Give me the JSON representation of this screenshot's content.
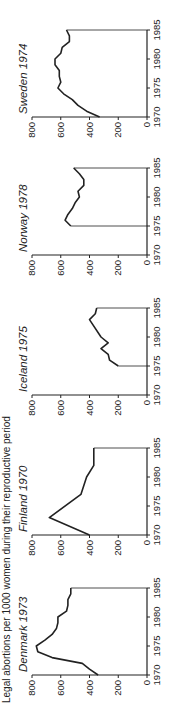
{
  "chart_data": {
    "type": "line",
    "title": "Legal abortions per 1000 women during their reproductive period",
    "xlabel": "",
    "ylabel": "",
    "ylim": [
      0,
      800
    ],
    "xlim": [
      1970,
      1985
    ],
    "x_ticks": [
      1970,
      1975,
      1980,
      1985
    ],
    "y_ticks": [
      0,
      200,
      400,
      600,
      800
    ],
    "grid": false,
    "orientation_note": "figure rotated 90 degrees counter-clockwise",
    "panels": [
      {
        "name": "Denmark 1973",
        "x": [
          1970,
          1971,
          1972,
          1973,
          1974,
          1975,
          1976,
          1977,
          1978,
          1979,
          1980,
          1981,
          1982,
          1983,
          1984,
          1985
        ],
        "values": [
          340,
          400,
          450,
          660,
          760,
          770,
          710,
          660,
          630,
          620,
          620,
          560,
          550,
          550,
          530,
          530
        ]
      },
      {
        "name": "Finland 1970",
        "x": [
          1970,
          1973,
          1977,
          1980,
          1982,
          1985
        ],
        "values": [
          400,
          680,
          460,
          420,
          370,
          370
        ]
      },
      {
        "name": "Iceland 1975",
        "x": [
          1975,
          1976,
          1977,
          1978,
          1979,
          1980,
          1983,
          1984,
          1985
        ],
        "values": [
          200,
          260,
          270,
          320,
          270,
          320,
          400,
          360,
          350
        ]
      },
      {
        "name": "Norway 1978",
        "x": [
          1975,
          1976,
          1977,
          1978,
          1979,
          1980,
          1981,
          1982,
          1983,
          1984,
          1985
        ],
        "values": [
          530,
          570,
          550,
          520,
          500,
          470,
          480,
          440,
          440,
          470,
          510
        ]
      },
      {
        "name": "Sweden 1974",
        "x": [
          1970,
          1971,
          1972,
          1973,
          1974,
          1975,
          1976,
          1977,
          1978,
          1979,
          1980,
          1981,
          1982,
          1983,
          1984,
          1985
        ],
        "values": [
          330,
          420,
          480,
          520,
          580,
          620,
          600,
          610,
          610,
          640,
          640,
          600,
          590,
          540,
          540,
          560
        ]
      }
    ]
  }
}
